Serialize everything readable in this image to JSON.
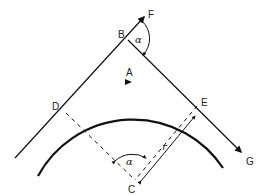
{
  "diagram": {
    "type": "geometry",
    "points": {
      "B": {
        "label": "B",
        "x": 128,
        "y": 40
      },
      "F": {
        "label": "F",
        "x": 145,
        "y": 14
      },
      "D": {
        "label": "D",
        "x": 66,
        "y": 113
      },
      "E": {
        "label": "E",
        "x": 197,
        "y": 106
      },
      "C": {
        "label": "C",
        "x": 135,
        "y": 180
      },
      "G": {
        "label": "G",
        "x": 242,
        "y": 153
      },
      "A": {
        "label": "A",
        "x": 130,
        "y": 82
      }
    },
    "angles": {
      "at_B": "α",
      "at_C": "α"
    },
    "radius_label": "r",
    "colors": {
      "line": "#111111",
      "background": "#ffffff"
    }
  }
}
